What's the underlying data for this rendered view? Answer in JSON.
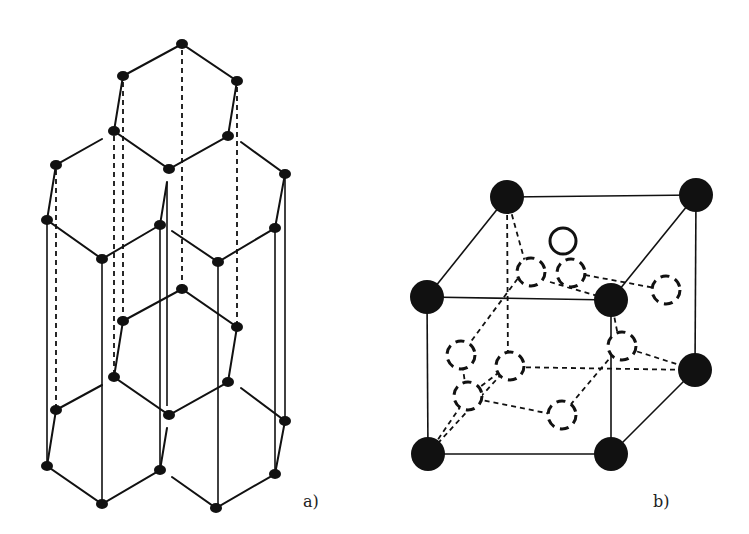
{
  "figure": {
    "panel_a": {
      "label": "a)",
      "description": "Hexagonal layered crystal structure (graphite-like), two stacked hexagonal layers connected by vertical lines",
      "top_layer_atoms": [
        [
          182,
          44
        ],
        [
          123,
          76
        ],
        [
          237,
          81
        ],
        [
          114,
          131
        ],
        [
          228,
          136
        ],
        [
          169,
          169
        ],
        [
          56,
          165
        ],
        [
          285,
          174
        ],
        [
          47,
          220
        ],
        [
          102,
          259
        ],
        [
          160,
          225
        ],
        [
          218,
          262
        ],
        [
          275,
          228
        ]
      ],
      "bottom_layer_atoms": [
        [
          182,
          289
        ],
        [
          123,
          321
        ],
        [
          237,
          327
        ],
        [
          114,
          377
        ],
        [
          228,
          382
        ],
        [
          169,
          415
        ],
        [
          56,
          410
        ],
        [
          285,
          421
        ],
        [
          47,
          466
        ],
        [
          160,
          470
        ],
        [
          102,
          504
        ],
        [
          216,
          508
        ],
        [
          275,
          474
        ]
      ]
    },
    "panel_b": {
      "label": "b)",
      "description": "Cubic unit cell with solid corner atoms, one open interstitial atom and dashed (hidden) atoms",
      "corner_atoms": [
        [
          507,
          197
        ],
        [
          696,
          195
        ],
        [
          427,
          297
        ],
        [
          611,
          300
        ],
        [
          695,
          370
        ],
        [
          428,
          454
        ],
        [
          611,
          454
        ]
      ],
      "hidden_corner": [
        510,
        367
      ],
      "open_atom": [
        563,
        241
      ],
      "dashed_atoms": [
        [
          531,
          272
        ],
        [
          571,
          273
        ],
        [
          663,
          290
        ],
        [
          461,
          355
        ],
        [
          510,
          364
        ],
        [
          620,
          346
        ],
        [
          467,
          397
        ],
        [
          561,
          416
        ]
      ]
    }
  },
  "colors": {
    "ink": "#111111",
    "background": "#ffffff"
  }
}
